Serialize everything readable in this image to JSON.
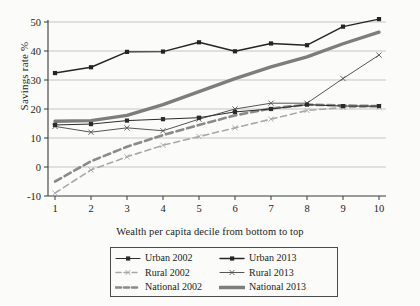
{
  "chart_data": {
    "type": "line",
    "title": "",
    "xlabel": "Wealth per capita decile from bottom to top",
    "ylabel": "Savings rate  %",
    "x": [
      1,
      2,
      3,
      4,
      5,
      6,
      7,
      8,
      9,
      10
    ],
    "xtick_labels": [
      "1",
      "2",
      "3",
      "4",
      "5",
      "6",
      "7",
      "8",
      "9",
      "10"
    ],
    "ytick_labels": [
      "-10",
      "0",
      "10",
      "20",
      "30",
      "40",
      "50"
    ],
    "yticks": [
      -10,
      0,
      10,
      20,
      30,
      40,
      50
    ],
    "ylim": [
      -10,
      53
    ],
    "xlim": [
      0.6,
      10.4
    ],
    "grid": "horizontal",
    "legend_position": "below-center",
    "series": [
      {
        "name": "Urban 2002",
        "style": "solid-thin-dark",
        "marker": "square",
        "color": "#2b2b2b",
        "values": [
          14.5,
          14.8,
          16.0,
          16.5,
          17.0,
          19.0,
          20.0,
          21.5,
          21.0,
          21.0
        ]
      },
      {
        "name": "Urban 2013",
        "style": "solid-dark",
        "marker": "square",
        "color": "#242424",
        "values": [
          32.4,
          34.4,
          39.7,
          39.8,
          43.0,
          39.9,
          42.6,
          42.0,
          48.4,
          51.0
        ]
      },
      {
        "name": "Rural 2002",
        "style": "dashed-light",
        "marker": "x",
        "color": "#a8a8a8",
        "values": [
          -9.0,
          -1.0,
          3.5,
          7.5,
          10.5,
          13.5,
          16.5,
          19.5,
          20.5,
          20.8
        ]
      },
      {
        "name": "Rural 2013",
        "style": "solid-thin-grey",
        "marker": "x",
        "color": "#555555",
        "values": [
          14.0,
          12.0,
          13.5,
          12.5,
          16.5,
          20.0,
          22.0,
          22.0,
          30.5,
          38.6
        ]
      },
      {
        "name": "National 2002",
        "style": "dashed-dark",
        "marker": "none",
        "color": "#8a8a8a",
        "values": [
          -5.0,
          2.0,
          7.0,
          11.0,
          14.5,
          17.8,
          20.2,
          21.5,
          21.2,
          21.0
        ]
      },
      {
        "name": "National 2013",
        "style": "solid-thick-grey",
        "marker": "none",
        "color": "#7d7d7d",
        "values": [
          15.8,
          16.0,
          17.8,
          21.5,
          26.0,
          30.5,
          34.5,
          38.0,
          42.5,
          46.5
        ]
      }
    ]
  },
  "legend": {
    "entries": [
      {
        "label": "Urban 2002",
        "series": "Urban 2002"
      },
      {
        "label": "Urban 2013",
        "series": "Urban 2013"
      },
      {
        "label": "Rural 2002",
        "series": "Rural 2002"
      },
      {
        "label": "Rural 2013",
        "series": "Rural 2013"
      },
      {
        "label": "National 2002",
        "series": "National 2002"
      },
      {
        "label": "National 2013",
        "series": "National 2013"
      }
    ]
  }
}
